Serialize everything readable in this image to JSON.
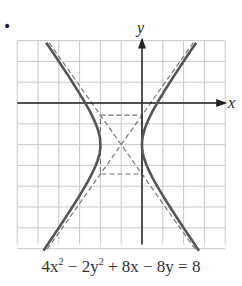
{
  "figure": {
    "bullet": "•",
    "x_axis_label": "x",
    "y_axis_label": "y",
    "equation_parts": [
      "4x",
      "2",
      " − 2y",
      "2",
      " + 8x − 8y = 8"
    ],
    "grid": {
      "x_min": -6,
      "x_max": 4,
      "y_min": -7,
      "y_max": 3,
      "step": 1
    },
    "hyperbola": {
      "center": [
        -1,
        -2
      ],
      "a": 1,
      "b": 1.4142,
      "orientation": "horizontal",
      "standard_form": "(x+1)^2/1 - (y+2)^2/2 = 1",
      "vertices": [
        [
          -2,
          -2
        ],
        [
          0,
          -2
        ]
      ]
    },
    "asymptotes": [
      "y + 2 = √2(x + 1)",
      "y + 2 = −√2(x + 1)"
    ],
    "colors": {
      "grid": "#c8c8c8",
      "axis": "#222222",
      "curve": "#555555",
      "dashed": "#777777",
      "text": "#333333"
    }
  }
}
